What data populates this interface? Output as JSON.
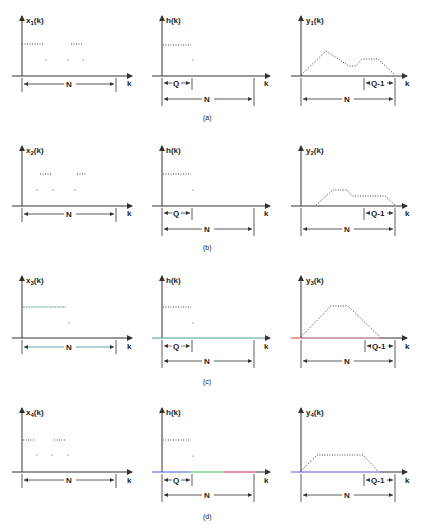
{
  "rows": [
    {
      "caption": "(a)",
      "x": {
        "label": "x",
        "sub": "1",
        "arg": "(k)"
      },
      "h": {
        "label": "h",
        "arg": "(k)"
      },
      "y": {
        "label": "y",
        "sub": "1",
        "arg": "(k)"
      }
    },
    {
      "caption": "(b)",
      "x": {
        "label": "x",
        "sub": "2",
        "arg": "(k)"
      },
      "h": {
        "label": "h",
        "arg": "(k)"
      },
      "y": {
        "label": "y",
        "sub": "2",
        "arg": "(k)"
      }
    },
    {
      "caption": "(c)",
      "x": {
        "label": "x",
        "sub": "3",
        "arg": "(k)"
      },
      "h": {
        "label": "h",
        "arg": "(k)"
      },
      "y": {
        "label": "y",
        "sub": "3",
        "arg": "(k)"
      }
    },
    {
      "caption": "(d)",
      "x": {
        "label": "x",
        "sub": "4",
        "arg": "(k)"
      },
      "h": {
        "label": "h",
        "arg": "(k)"
      },
      "y": {
        "label": "y",
        "sub": "4",
        "arg": "(k)"
      }
    }
  ],
  "axis_label": "k",
  "dims": {
    "N": "N",
    "Q": "Q",
    "Q1": "Q-1"
  },
  "colors": {
    "red": "#d23a3a",
    "green": "#3fbf5a",
    "blue": "#4a5ad8",
    "teal": "#3a9a9a",
    "ink": "#333333"
  }
}
